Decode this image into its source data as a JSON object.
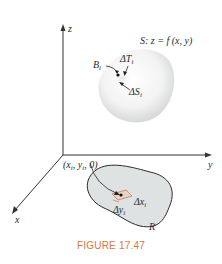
{
  "figure": {
    "caption": "FIGURE 17.47",
    "colors": {
      "axis": "#333333",
      "region_fill": "#dfe2e2",
      "region_stroke": "#2a2a2a",
      "surface_fill": "#f4f5f4",
      "surface_shadow": "#d2d5d4",
      "patch_stroke": "#c9876a",
      "caption": "#d9763f"
    },
    "axes": {
      "z_label": "z",
      "y_label": "y",
      "x_label": "x"
    },
    "surface": {
      "equation_label": "S:  z = f (x, y)",
      "B_label": "B",
      "B_sub": "i",
      "deltaT_label": "ΔT",
      "deltaT_sub": "i",
      "deltaS_label": "ΔS",
      "deltaS_sub": "i"
    },
    "region": {
      "point_label_pre": "(x",
      "point_label_sub1": "i",
      "point_label_mid": ", y",
      "point_label_sub2": "i",
      "point_label_post": ", 0)",
      "dx_label": "Δx",
      "dx_sub": "i",
      "dy_label": "Δy",
      "dy_sub": "i",
      "R_label": "R"
    }
  }
}
